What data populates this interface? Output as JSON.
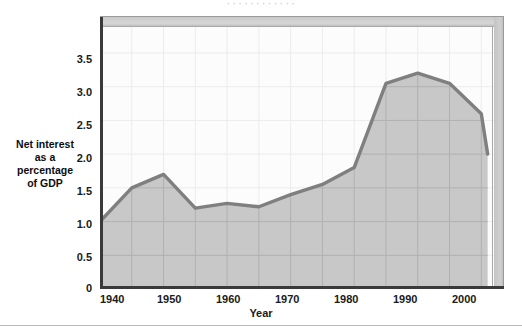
{
  "figure": {
    "top_clipped_text": "· ·    · ·          · ·  · ·                              · ·                              · ·",
    "background_color": "#ffffff",
    "line_color": "#7f7f7f",
    "area_fill_color": "#c8c8c8",
    "plot_background_color": "#fcfcfc",
    "gridline_color": "#e8e8e8",
    "axis_color": "#3a3a3a",
    "bevel_color": "#d2d2d2"
  },
  "chart_data": {
    "type": "area",
    "title": "",
    "subtitle": "",
    "xlabel": "Year",
    "ylabel": "Net interest as a percentage of GDP",
    "ylabel_lines": [
      "Net interest",
      "as a",
      "percentage",
      "of GDP"
    ],
    "xlim": [
      1940,
      2002
    ],
    "ylim": [
      0,
      3.9
    ],
    "yticks": [
      0,
      0.5,
      1.0,
      1.5,
      2.0,
      2.5,
      3.0,
      3.5
    ],
    "ytick_labels": [
      "0",
      "0.5",
      "1.0",
      "1.5",
      "2.0",
      "2.5",
      "3.0",
      "3.5"
    ],
    "xticks": [
      1940,
      1950,
      1960,
      1970,
      1980,
      1990,
      2000
    ],
    "xtick_labels": [
      "1940",
      "1950",
      "1960",
      "1970",
      "1980",
      "1990",
      "2000"
    ],
    "x_minor_step": 5,
    "grid": true,
    "legend": "none",
    "series": [
      {
        "name": "Net interest as a percentage of GDP",
        "x": [
          1940,
          1945,
          1950,
          1955,
          1960,
          1965,
          1970,
          1975,
          1980,
          1985,
          1990,
          1995,
          2000,
          2001
        ],
        "values": [
          1.0,
          1.5,
          1.7,
          1.2,
          1.27,
          1.22,
          1.4,
          1.55,
          1.8,
          3.05,
          3.2,
          3.05,
          2.6,
          2.0
        ]
      }
    ]
  }
}
